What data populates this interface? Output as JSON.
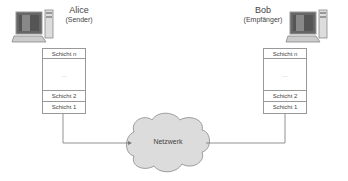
{
  "sender": {
    "name": "Alice",
    "role": "(Sender)",
    "icon": "computer-icon",
    "layers": [
      "Schicht n",
      "...",
      "Schicht 2",
      "Schicht 1"
    ]
  },
  "receiver": {
    "name": "Bob",
    "role": "(Empfänger)",
    "icon": "computer-icon",
    "layers": [
      "Schicht n",
      "...",
      "Schicht 2",
      "Schicht 1"
    ]
  },
  "network": {
    "label": "Netzwerk",
    "icon": "cloud-icon"
  },
  "colors": {
    "line": "#777777",
    "cloud_fill": "#dcdcdc",
    "box_border": "#999999"
  }
}
